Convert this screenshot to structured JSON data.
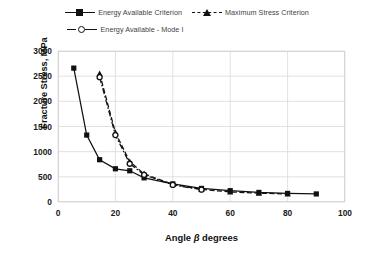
{
  "chart_data": {
    "type": "line",
    "title": "",
    "xlabel": "Angle β degrees",
    "ylabel": "Fracture Stress, MPa",
    "xlim": [
      0,
      100
    ],
    "ylim": [
      0,
      3000
    ],
    "xticks": [
      0,
      20,
      40,
      60,
      80,
      100
    ],
    "yticks": [
      0,
      500,
      1000,
      1500,
      2000,
      2500,
      3000
    ],
    "grid": true,
    "legend_position": "top-center",
    "series": [
      {
        "name": "Energy Available Criterion",
        "marker": "square",
        "line": "solid",
        "color": "#111111",
        "x": [
          5.5,
          10,
          14.5,
          20,
          25,
          30,
          40,
          50,
          60,
          70,
          80,
          90
        ],
        "y": [
          2660,
          1330,
          840,
          660,
          620,
          480,
          360,
          270,
          225,
          190,
          170,
          160
        ]
      },
      {
        "name": "Maximum Stress Criterion",
        "marker": "triangle",
        "line": "dashed",
        "color": "#111111",
        "x": [
          14.5,
          20,
          25,
          30,
          40,
          50,
          60,
          70,
          80
        ],
        "y": [
          2550,
          1380,
          800,
          560,
          350,
          250,
          200,
          175,
          160
        ]
      },
      {
        "name": "Energy Available - Mode I",
        "marker": "circle",
        "line": "dash-dot",
        "color": "#111111",
        "x": [
          14.5,
          20,
          25,
          30,
          40,
          50
        ],
        "y": [
          2480,
          1330,
          760,
          540,
          340,
          245
        ]
      }
    ]
  },
  "legend": {
    "items": [
      {
        "label": "Energy Available Criterion",
        "marker": "square-marker",
        "style": "solid"
      },
      {
        "label": "Maximum Stress Criterion",
        "marker": "triangle-marker",
        "style": "dashed"
      },
      {
        "label": "Energy Available - Mode I",
        "marker": "circle-marker",
        "style": "dash-dot"
      }
    ]
  },
  "axes": {
    "y_label": "Fracture Stress, MPa",
    "x_label_prefix": "Angle ",
    "x_label_symbol": "β",
    "x_label_suffix": " degrees",
    "y_ticks": [
      "3000",
      "2500",
      "2000",
      "1500",
      "1000",
      "500",
      "0"
    ],
    "x_ticks": [
      "0",
      "20",
      "40",
      "60",
      "80",
      "100"
    ]
  }
}
